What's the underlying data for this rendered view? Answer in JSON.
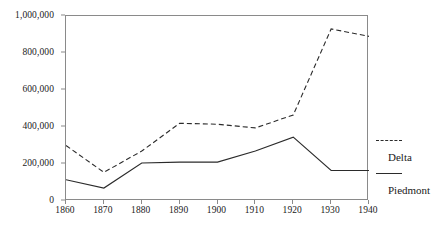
{
  "chart_data": {
    "type": "line",
    "title": "",
    "xlabel": "",
    "ylabel": "",
    "x": [
      1860,
      1870,
      1880,
      1890,
      1900,
      1910,
      1920,
      1930,
      1940
    ],
    "xtick_labels": [
      "1860",
      "1870",
      "1880",
      "1890",
      "1900",
      "1910",
      "1920",
      "1930",
      "1940"
    ],
    "ytick_labels": [
      "0",
      "200,000",
      "400,000",
      "600,000",
      "800,000",
      "1,000,000"
    ],
    "ytick_values": [
      0,
      200000,
      400000,
      600000,
      800000,
      1000000
    ],
    "xlim": [
      1860,
      1940
    ],
    "ylim": [
      0,
      1000000
    ],
    "grid": false,
    "legend_position": "right",
    "series": [
      {
        "name": "Delta",
        "style": "dashed",
        "color": "#2b2b2b",
        "values": [
          300000,
          155000,
          270000,
          420000,
          415000,
          395000,
          465000,
          930000,
          890000
        ]
      },
      {
        "name": "Piedmont",
        "style": "solid",
        "color": "#2b2b2b",
        "values": [
          115000,
          70000,
          205000,
          210000,
          210000,
          270000,
          345000,
          165000,
          165000
        ]
      }
    ]
  },
  "legend": {
    "entries": [
      {
        "label": "Delta",
        "style": "dashed"
      },
      {
        "label": "Piedmont",
        "style": "solid"
      }
    ]
  },
  "colors": {
    "line": "#2b2b2b",
    "axis": "#8a8a8a",
    "text": "#1a1a1a",
    "background": "#ffffff"
  }
}
